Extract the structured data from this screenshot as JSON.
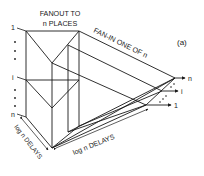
{
  "figure_label": "(a)",
  "fanout_label_line1": "FANOUT TO",
  "fanout_label_line2": "n PLACES",
  "fanin_label": "FAN-IN ONE OF n",
  "left_delay_label": "log n DELAYS",
  "bottom_delay_label": "log n DELAYS",
  "input_labels": {
    "top": "1",
    "middle": "i",
    "bottom": "n"
  },
  "output_labels": {
    "top": "n",
    "middle": "i",
    "bottom": "1"
  },
  "colors": {
    "ink": "#1a1a1a",
    "background": "#ffffff"
  }
}
